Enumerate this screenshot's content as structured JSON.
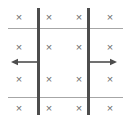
{
  "figure": {
    "kind": "physics-field-diagram",
    "width": 131,
    "height": 123,
    "background_color": "#ffffff"
  },
  "symbols": {
    "field_into_page": "×",
    "field_into_page_name": "x-field-into-page-marker",
    "field_into_page_color": "#6e6e6e"
  },
  "markers": {
    "columns_x": [
      19,
      49,
      79,
      110
    ],
    "rows_y": [
      17,
      47,
      79,
      108
    ],
    "count": 16,
    "items": [
      {
        "label": "×",
        "x": 19,
        "y": 17,
        "row": 1,
        "col": 1
      },
      {
        "label": "×",
        "x": 49,
        "y": 17,
        "row": 1,
        "col": 2
      },
      {
        "label": "×",
        "x": 79,
        "y": 17,
        "row": 1,
        "col": 3
      },
      {
        "label": "×",
        "x": 110,
        "y": 17,
        "row": 1,
        "col": 4
      },
      {
        "label": "×",
        "x": 19,
        "y": 47,
        "row": 2,
        "col": 1
      },
      {
        "label": "×",
        "x": 49,
        "y": 47,
        "row": 2,
        "col": 2
      },
      {
        "label": "×",
        "x": 79,
        "y": 47,
        "row": 2,
        "col": 3
      },
      {
        "label": "×",
        "x": 110,
        "y": 47,
        "row": 2,
        "col": 4
      },
      {
        "label": "×",
        "x": 19,
        "y": 79,
        "row": 3,
        "col": 1
      },
      {
        "label": "×",
        "x": 49,
        "y": 79,
        "row": 3,
        "col": 2
      },
      {
        "label": "×",
        "x": 79,
        "y": 79,
        "row": 3,
        "col": 3
      },
      {
        "label": "×",
        "x": 110,
        "y": 79,
        "row": 3,
        "col": 4
      },
      {
        "label": "×",
        "x": 19,
        "y": 108,
        "row": 4,
        "col": 1
      },
      {
        "label": "×",
        "x": 49,
        "y": 108,
        "row": 4,
        "col": 2
      },
      {
        "label": "×",
        "x": 79,
        "y": 108,
        "row": 4,
        "col": 3
      },
      {
        "label": "×",
        "x": 110,
        "y": 108,
        "row": 4,
        "col": 4
      }
    ]
  },
  "vertical_lines": {
    "color": "#4d4d4d",
    "stroke_width": 2.2,
    "items": [
      {
        "name": "left-conductor",
        "x": 38.5,
        "y1": 8,
        "y2": 115
      },
      {
        "name": "right-conductor",
        "x": 88.5,
        "y1": 8,
        "y2": 115
      }
    ]
  },
  "horizontal_lines": {
    "color": "#a6a6a6",
    "stroke_width": 1.1,
    "items": [
      {
        "name": "top-boundary-line",
        "y": 28.5,
        "x1": 8,
        "x2": 123
      },
      {
        "name": "bottom-boundary-line",
        "y": 97.5,
        "x1": 8,
        "x2": 123
      }
    ]
  },
  "arrows": {
    "color": "#4d4d4d",
    "stroke_width": 1.6,
    "head_length": 7,
    "head_half_width": 3.2,
    "items": [
      {
        "name": "left-arrow",
        "direction": "left",
        "tail_x": 38.5,
        "tip_x": 11,
        "y": 62
      },
      {
        "name": "right-arrow",
        "direction": "right",
        "tail_x": 88.5,
        "tip_x": 117,
        "y": 62
      }
    ]
  }
}
